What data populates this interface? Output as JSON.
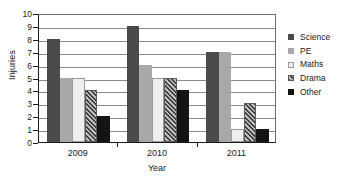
{
  "chart_data": {
    "type": "bar",
    "title": "",
    "xlabel": "Year",
    "ylabel": "Injuries",
    "categories": [
      "2009",
      "2010",
      "2011"
    ],
    "series": [
      {
        "name": "Science",
        "values": [
          8,
          9,
          7
        ],
        "color": "#4a4a4a",
        "fill": "solid-dark-gray"
      },
      {
        "name": "PE",
        "values": [
          5,
          6,
          7
        ],
        "color": "#a8a8a8",
        "fill": "solid-mid-gray"
      },
      {
        "name": "Maths",
        "values": [
          5,
          5,
          1
        ],
        "color": "#eeeeee",
        "fill": "solid-white"
      },
      {
        "name": "Drama",
        "values": [
          4,
          5,
          3
        ],
        "color": "#b9b9b9",
        "fill": "diagonal-hatch"
      },
      {
        "name": "Other",
        "values": [
          2,
          4,
          1
        ],
        "color": "#141414",
        "fill": "solid-black"
      }
    ],
    "ylim": [
      0,
      10
    ],
    "yticks": [
      "0",
      "1",
      "2",
      "3",
      "4",
      "5",
      "6",
      "7",
      "8",
      "9",
      "10"
    ],
    "grid": true,
    "legend_position": "right"
  }
}
